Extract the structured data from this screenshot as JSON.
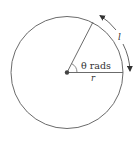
{
  "diagram": {
    "angle_label": "θ rads",
    "radius_label": "r",
    "arc_label": "l",
    "colors": {
      "stroke": "#6b6b6b",
      "dot": "#444444",
      "text": "#333333",
      "background": "#ffffff"
    }
  }
}
